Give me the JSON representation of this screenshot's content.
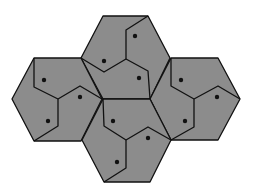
{
  "diagram": {
    "fill_color": "#8c8c8c",
    "line_color": "#111111",
    "background": "#ffffff",
    "hexagons": [
      {
        "name": "top",
        "points": "103,16 148,16 170,58 150,99 103,99 81,58",
        "dividers": [
          "148,16 126,30 126,59",
          "126,59 148,71 150,99",
          "126,59 104,72 81,58"
        ],
        "dots": [
          [
            135,
            36
          ],
          [
            104,
            61
          ],
          [
            139,
            78
          ]
        ]
      },
      {
        "name": "left",
        "points": "34,58 81,58 102,99 81,141 34,141 12,99",
        "dividers": [
          "34,58 34,87 58,99",
          "58,99 58,126 34,141",
          "58,99 80,86 102,99"
        ],
        "dots": [
          [
            44,
            80
          ],
          [
            80,
            97
          ],
          [
            48,
            121
          ]
        ]
      },
      {
        "name": "right",
        "points": "171,58 218,58 240,99 218,140 171,140 150,99",
        "dividers": [
          "171,58 171,86 194,99",
          "194,99 194,127 171,140",
          "194,99 218,86 240,99"
        ],
        "dots": [
          [
            181,
            80
          ],
          [
            217,
            97
          ],
          [
            185,
            121
          ]
        ]
      },
      {
        "name": "bottom",
        "points": "103,99 150,99 171,140 150,182 104,182 82,140",
        "dividers": [
          "103,99 104,126 126,140",
          "126,140 126,168 104,182",
          "126,140 148,127 171,140"
        ],
        "dots": [
          [
            113,
            121
          ],
          [
            148,
            138
          ],
          [
            117,
            162
          ]
        ]
      }
    ]
  }
}
